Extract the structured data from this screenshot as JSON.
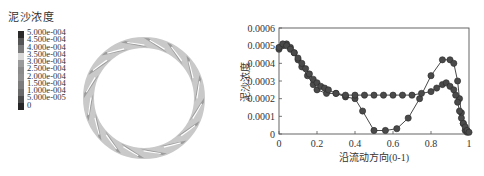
{
  "contour": {
    "legend_title": "泥沙浓度",
    "levels": [
      "5.000e-004",
      "4.500e-004",
      "4.000e-004",
      "3.500e-004",
      "3.000e-004",
      "2.500e-004",
      "2.000e-004",
      "1.500e-004",
      "1.000e-004",
      "5.000e-005",
      "0"
    ],
    "colorbar": [
      "#2a2a2a",
      "#555555",
      "#7a7a7a",
      "#d8d8d8",
      "#9a9a9a",
      "#8a8a8a",
      "#8f8f8f",
      "#7c7c7c",
      "#6a6a6a",
      "#4a4a4a",
      "#262626"
    ],
    "ring_fill": "#c9c9c9",
    "blade_color": "#8c8c8c",
    "blade_count": 16
  },
  "chart_data": {
    "type": "line",
    "title": "",
    "xlabel": "沿流动方向(0-1)",
    "ylabel": "泥沙浓度",
    "xlim": [
      0,
      1
    ],
    "ylim": [
      0,
      0.0006
    ],
    "xticks": [
      "0",
      "0.2",
      "0.4",
      "0.6",
      "0.8",
      "1"
    ],
    "yticks": [
      "0",
      "0.0001",
      "0.0002",
      "0.0003",
      "0.0004",
      "0.0005",
      "0.0006"
    ],
    "grid": false,
    "legend": "none",
    "marker": "circle",
    "series": [
      {
        "name": "series-1",
        "x": [
          0,
          0.02,
          0.04,
          0.06,
          0.08,
          0.1,
          0.12,
          0.15,
          0.18,
          0.2,
          0.25,
          0.3,
          0.35,
          0.4,
          0.44,
          0.5,
          0.56,
          0.62,
          0.68,
          0.74,
          0.8,
          0.86,
          0.9,
          0.92,
          0.94,
          0.95,
          0.96,
          0.97,
          0.98,
          0.99
        ],
        "y": [
          0.00048,
          0.0005,
          0.00051,
          0.00049,
          0.00046,
          0.00042,
          0.00038,
          0.00033,
          0.00028,
          0.00025,
          0.00023,
          0.00023,
          0.00021,
          0.0002,
          0.00013,
          2e-05,
          2e-05,
          3e-05,
          9e-05,
          0.0002,
          0.00033,
          0.00042,
          0.00042,
          0.0004,
          0.0003,
          0.0002,
          0.00012,
          6e-05,
          2e-05,
          1e-05
        ]
      },
      {
        "name": "series-2",
        "x": [
          0,
          0.02,
          0.04,
          0.06,
          0.08,
          0.1,
          0.12,
          0.14,
          0.16,
          0.18,
          0.2,
          0.22,
          0.24,
          0.26,
          0.3,
          0.35,
          0.4,
          0.45,
          0.5,
          0.55,
          0.6,
          0.65,
          0.7,
          0.75,
          0.8,
          0.83,
          0.86,
          0.88,
          0.9,
          0.92,
          0.93,
          0.94,
          0.95,
          0.96,
          0.97,
          0.98,
          0.99,
          1.0
        ],
        "y": [
          0.00049,
          0.00051,
          0.0005,
          0.00048,
          0.00046,
          0.00043,
          0.0004,
          0.00037,
          0.00034,
          0.00031,
          0.00029,
          0.00027,
          0.00026,
          0.00025,
          0.00023,
          0.00022,
          0.00022,
          0.00022,
          0.00022,
          0.00022,
          0.00022,
          0.00022,
          0.00022,
          0.00023,
          0.00024,
          0.00026,
          0.00028,
          0.00029,
          0.00027,
          0.00025,
          0.00022,
          0.00018,
          0.00013,
          9e-05,
          6e-05,
          4e-05,
          2e-05,
          1e-05
        ]
      }
    ]
  }
}
